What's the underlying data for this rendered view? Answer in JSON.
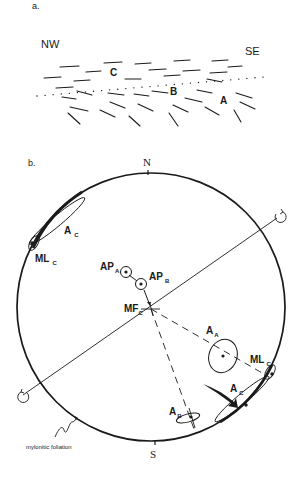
{
  "panel_a": {
    "label": "a.",
    "left_direction": "NW",
    "right_direction": "SE",
    "zones": [
      "C",
      "B",
      "A"
    ]
  },
  "panel_b": {
    "label": "b.",
    "north": "N",
    "south": "S",
    "labels": {
      "ac_upper": "A",
      "ac_upper_sub": "C",
      "mlc_upper": "ML",
      "mlc_upper_sub": "C",
      "apa": "AP",
      "apa_sub": "A",
      "apb": "AP",
      "apb_sub": "B",
      "mfc": "MF",
      "mfc_sub": "C",
      "aa": "A",
      "aa_sub": "A",
      "mlc_lower": "ML",
      "mlc_lower_sub": "C",
      "ac_lower": "A",
      "ac_lower_sub": "C",
      "ab": "A",
      "ab_sub": "B"
    },
    "annotation": "mylonitic foliation"
  },
  "colors": {
    "ink": "#1a1a1a",
    "background": "#ffffff"
  }
}
